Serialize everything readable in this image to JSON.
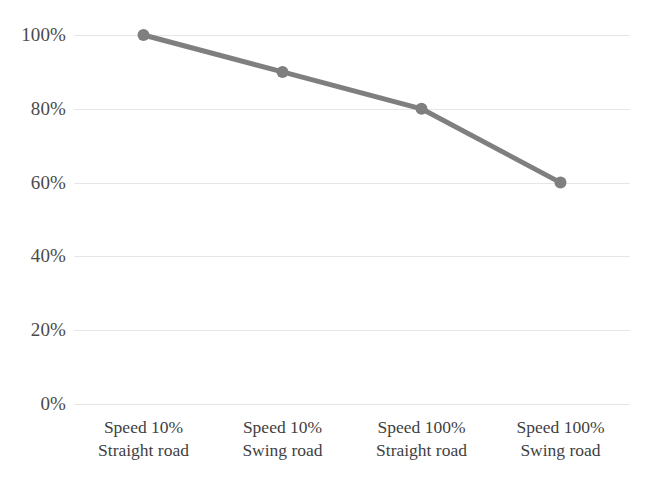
{
  "chart_data": {
    "type": "line",
    "title": "",
    "subtitle": "",
    "xlabel": "",
    "ylabel": "",
    "categories": [
      "Speed 10%\nStraight road",
      "Speed 10%\nSwing road",
      "Speed 100%\nStraight road",
      "Speed 100%\nSwing road"
    ],
    "category_lines": [
      {
        "line1": "Speed 10%",
        "line2": "Straight road"
      },
      {
        "line1": "Speed 10%",
        "line2": "Swing road"
      },
      {
        "line1": "Speed 100%",
        "line2": "Straight road"
      },
      {
        "line1": "Speed 100%",
        "line2": "Swing road"
      }
    ],
    "values": [
      100,
      90,
      80,
      60
    ],
    "value_labels": [
      "100%",
      "90%",
      "80%",
      "60%"
    ],
    "ylim": [
      0,
      100
    ],
    "ytick_values": [
      100,
      80,
      60,
      40,
      20,
      0
    ],
    "ytick_labels": [
      "100%",
      "80%",
      "60%",
      "40%",
      "20%",
      "0%"
    ],
    "grid": true,
    "grid_axis": "y",
    "legend": false,
    "legend_position": "none",
    "series": [
      {
        "name": "",
        "values": [
          100,
          90,
          80,
          60
        ],
        "color": "#7f7f7f",
        "marker": "circle",
        "marker_size": 12,
        "line_width": 5
      }
    ],
    "colors": {
      "line": "#7f7f7f",
      "marker": "#7f7f7f",
      "gridline": "#e6e6e6",
      "tick_text": "#4a4a4a",
      "category_text": "#3f3f3f",
      "background": "#ffffff"
    }
  }
}
